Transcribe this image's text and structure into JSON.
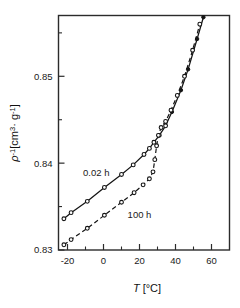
{
  "chart_data": {
    "type": "line",
    "title": "",
    "subtitle": "",
    "xlabel": "T  [°C]",
    "xlabel_symbol": "T",
    "xlabel_units": "[°C]",
    "ylabel": "ρ⁻¹ [cm³·g⁻¹]",
    "ylabel_symbol": "ρ",
    "ylabel_exponent": "-1",
    "ylabel_units": "[cm³· g⁻¹]",
    "xlim": [
      -25,
      70
    ],
    "ylim": [
      0.83,
      0.857
    ],
    "xticks": [
      -20,
      0,
      20,
      40,
      60
    ],
    "xticklabels": [
      "-20",
      "0",
      "20",
      "40",
      "60"
    ],
    "xminorticks": [
      -10,
      10,
      30,
      50
    ],
    "yticks": [
      0.83,
      0.84,
      0.85
    ],
    "yticklabels": [
      "0.83",
      "0.84",
      "0.85"
    ],
    "yminorticks": [
      0.835,
      0.845,
      0.855
    ],
    "grid": false,
    "legend_position": "inline-annotation",
    "annotations": [
      {
        "text": "0.02 h",
        "x": -4,
        "y": 0.8385,
        "series": "0.02 h"
      },
      {
        "text": "100 h",
        "x": 20,
        "y": 0.8337,
        "series": "100 h"
      }
    ],
    "series": [
      {
        "name": "0.02 h",
        "style": "solid",
        "marker": "open-circle",
        "points": [
          {
            "x": -22.0,
            "y": 0.8336
          },
          {
            "x": -18.0,
            "y": 0.8343
          },
          {
            "x": -9.0,
            "y": 0.8356
          },
          {
            "x": 0.5,
            "y": 0.8372
          },
          {
            "x": 10.0,
            "y": 0.8387
          },
          {
            "x": 16.5,
            "y": 0.8398
          },
          {
            "x": 22.5,
            "y": 0.841
          },
          {
            "x": 25.5,
            "y": 0.8417
          },
          {
            "x": 28.0,
            "y": 0.8424
          },
          {
            "x": 31.0,
            "y": 0.8432
          },
          {
            "x": 34.5,
            "y": 0.8443
          },
          {
            "x": 38.0,
            "y": 0.8459
          },
          {
            "x": 43.0,
            "y": 0.8484
          },
          {
            "x": 47.0,
            "y": 0.8508
          },
          {
            "x": 52.0,
            "y": 0.8543
          },
          {
            "x": 55.5,
            "y": 0.8568
          }
        ]
      },
      {
        "name": "100 h",
        "style": "dashed",
        "marker": "open-circle",
        "points": [
          {
            "x": -22.0,
            "y": 0.8306
          },
          {
            "x": -18.0,
            "y": 0.8312
          },
          {
            "x": -9.0,
            "y": 0.8325
          },
          {
            "x": 0.5,
            "y": 0.834
          },
          {
            "x": 10.0,
            "y": 0.8355
          },
          {
            "x": 17.0,
            "y": 0.8366
          },
          {
            "x": 22.0,
            "y": 0.8375
          },
          {
            "x": 25.5,
            "y": 0.8382
          },
          {
            "x": 27.5,
            "y": 0.839
          },
          {
            "x": 28.5,
            "y": 0.8404
          },
          {
            "x": 29.5,
            "y": 0.842
          },
          {
            "x": 30.5,
            "y": 0.8432
          },
          {
            "x": 32.0,
            "y": 0.8441
          },
          {
            "x": 34.5,
            "y": 0.8448
          },
          {
            "x": 37.5,
            "y": 0.8461
          },
          {
            "x": 41.0,
            "y": 0.8478
          },
          {
            "x": 45.0,
            "y": 0.85
          },
          {
            "x": 49.5,
            "y": 0.853
          },
          {
            "x": 53.5,
            "y": 0.856
          }
        ]
      }
    ],
    "filled_markers_series": "0.02 h",
    "filled_marker_points": [
      {
        "x": 38.0,
        "y": 0.8459
      },
      {
        "x": 43.0,
        "y": 0.8484
      },
      {
        "x": 47.0,
        "y": 0.8508
      },
      {
        "x": 52.0,
        "y": 0.8543
      },
      {
        "x": 55.5,
        "y": 0.8568
      }
    ]
  },
  "colors": {
    "background": "#ffffff",
    "axis": "#2b2b2b",
    "curve": "#141414",
    "text": "#1a1a1a"
  }
}
